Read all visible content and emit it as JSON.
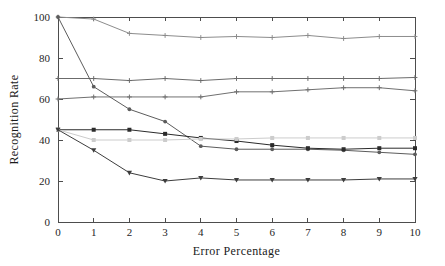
{
  "chart_data": {
    "type": "line",
    "title": "",
    "xlabel": "Error Percentage",
    "ylabel": "Recognition Rate",
    "xlim": [
      0,
      10
    ],
    "ylim": [
      0,
      100
    ],
    "xticks": [
      0,
      1,
      2,
      3,
      4,
      5,
      6,
      7,
      8,
      9,
      10
    ],
    "yticks": [
      0,
      20,
      40,
      60,
      80,
      100
    ],
    "xtick_labels": [
      "0",
      "1",
      "2",
      "3",
      "4",
      "5",
      "6",
      "7",
      "8",
      "9",
      "10"
    ],
    "ytick_labels": [
      "0",
      "20",
      "40",
      "60",
      "80",
      "100"
    ],
    "grid": false,
    "legend": "none",
    "x": [
      0,
      1,
      2,
      3,
      4,
      5,
      6,
      7,
      8,
      9,
      10
    ],
    "series": [
      {
        "name": "series-1",
        "color": "#8c8c8c",
        "marker": "plus",
        "values": [
          100,
          99,
          92,
          91,
          90,
          90.5,
          90,
          91,
          89.5,
          90.5,
          90.5
        ]
      },
      {
        "name": "series-2",
        "color": "#6b6b6b",
        "marker": "plus",
        "values": [
          70,
          70,
          69,
          70,
          69,
          70,
          70,
          70,
          70,
          70,
          70.5
        ]
      },
      {
        "name": "series-3",
        "color": "#707070",
        "marker": "plus",
        "values": [
          60,
          61,
          61,
          61,
          61,
          63.5,
          63.5,
          64.5,
          65.5,
          65.5,
          64
        ]
      },
      {
        "name": "series-4",
        "color": "#5c5c5c",
        "marker": "circle",
        "values": [
          100,
          66,
          55,
          49,
          37,
          35.5,
          35.5,
          35.5,
          35,
          34,
          33
        ]
      },
      {
        "name": "series-5",
        "color": "#2b2b2b",
        "marker": "square",
        "values": [
          45,
          45,
          45,
          43,
          41,
          39.5,
          37.5,
          36,
          35.5,
          36,
          36
        ]
      },
      {
        "name": "series-6",
        "color": "#cccccc",
        "marker": "square",
        "values": [
          45,
          40,
          40,
          40,
          40.5,
          40.5,
          41,
          41,
          41,
          41,
          41
        ]
      },
      {
        "name": "series-7",
        "color": "#3d3d3d",
        "marker": "triangle-down",
        "values": [
          45,
          35,
          24,
          20,
          21.5,
          20.5,
          20.5,
          20.5,
          20.5,
          21,
          21
        ]
      }
    ]
  },
  "figure": {
    "background_color": "#ffffff",
    "axis_color": "#4d4d4d"
  }
}
